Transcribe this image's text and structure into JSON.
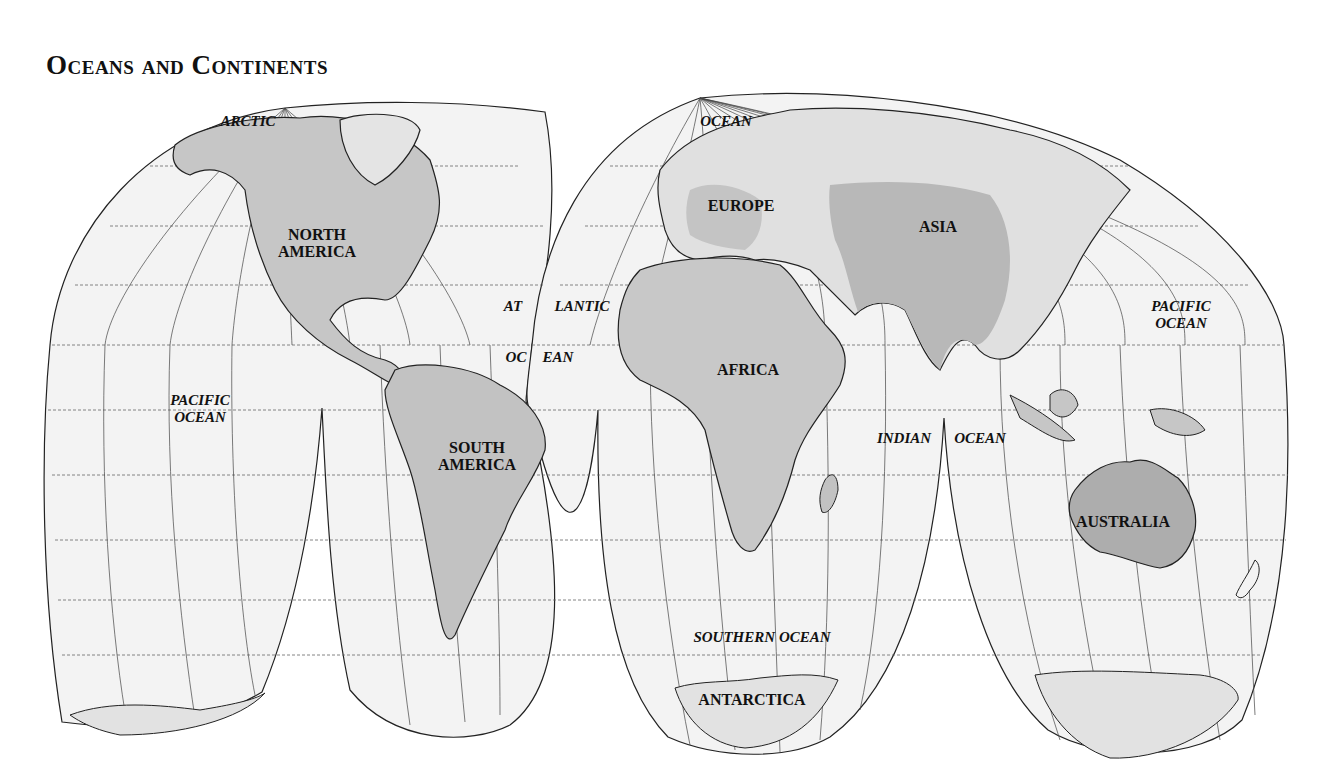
{
  "title": "Oceans and Continents",
  "projection": "Interrupted Goode homolosine",
  "colors": {
    "ocean": "#f2f2f2",
    "land_light": "#dcdcdc",
    "land_mid": "#c4c4c4",
    "land_dark": "#a9a9a9",
    "outline": "#222222",
    "graticule": "#555555"
  },
  "continents": [
    {
      "name": "NORTH\nAMERICA",
      "line1": "NORTH",
      "line2": "AMERICA"
    },
    {
      "name": "SOUTH\nAMERICA",
      "line1": "SOUTH",
      "line2": "AMERICA"
    },
    {
      "name": "EUROPE",
      "line1": "EUROPE"
    },
    {
      "name": "ASIA",
      "line1": "ASIA"
    },
    {
      "name": "AFRICA",
      "line1": "AFRICA"
    },
    {
      "name": "AUSTRALIA",
      "line1": "AUSTRALIA"
    },
    {
      "name": "ANTARCTICA",
      "line1": "ANTARCTICA"
    }
  ],
  "oceans": [
    {
      "id": "arctic-1",
      "text": "ARCTIC"
    },
    {
      "id": "arctic-2",
      "text": "OCEAN"
    },
    {
      "id": "atlantic-1a",
      "text": "AT"
    },
    {
      "id": "atlantic-1b",
      "text": "LANTIC"
    },
    {
      "id": "atlantic-2a",
      "text": "OC"
    },
    {
      "id": "atlantic-2b",
      "text": "EAN"
    },
    {
      "id": "pacific-west-1",
      "text": "PACIFIC"
    },
    {
      "id": "pacific-west-2",
      "text": "OCEAN"
    },
    {
      "id": "pacific-east-1",
      "text": "PACIFIC"
    },
    {
      "id": "pacific-east-2",
      "text": "OCEAN"
    },
    {
      "id": "indian-1",
      "text": "INDIAN"
    },
    {
      "id": "indian-2",
      "text": "OCEAN"
    },
    {
      "id": "southern",
      "text": "SOUTHERN OCEAN"
    }
  ]
}
